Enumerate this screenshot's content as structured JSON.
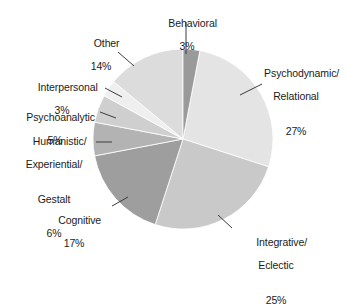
{
  "chart_data": {
    "type": "pie",
    "title": "",
    "subtitle": "",
    "xlabel": "",
    "ylabel": "",
    "legend_position": "none",
    "grid": false,
    "labels_show_percent": true,
    "categories": [
      "Psychodynamic/\nRelational",
      "Integrative/\nEclectic",
      "Cognitive",
      "Humanistic/\nExperiential/\nGestalt",
      "Psychoanalytic",
      "Interpersonal",
      "Other",
      "Behavioral"
    ],
    "values": [
      27,
      25,
      17,
      6,
      5,
      3,
      14,
      3
    ],
    "slices": [
      {
        "name": "Psychodynamic/Relational",
        "label_lines": [
          "Psychodynamic/",
          "Relational"
        ],
        "percent_text": "27%",
        "value": 27,
        "color": "#e4e4e4",
        "start_deg": 10.8,
        "end_deg": 108.0
      },
      {
        "name": "Integrative/Eclectic",
        "label_lines": [
          "Integrative/",
          "Eclectic"
        ],
        "percent_text": "25%",
        "value": 25,
        "color": "#c9c9c9",
        "start_deg": 108.0,
        "end_deg": 198.0
      },
      {
        "name": "Cognitive",
        "label_lines": [
          "Cognitive"
        ],
        "percent_text": "17%",
        "value": 17,
        "color": "#9e9e9e",
        "start_deg": 198.0,
        "end_deg": 259.2
      },
      {
        "name": "Humanistic/Experiential/Gestalt",
        "label_lines": [
          "Humanistic/",
          "Experiential/",
          "Gestalt"
        ],
        "percent_text": "6%",
        "value": 6,
        "color": "#b3b3b3",
        "start_deg": 259.2,
        "end_deg": 280.8
      },
      {
        "name": "Psychoanalytic",
        "label_lines": [
          "Psychoanalytic"
        ],
        "percent_text": "5%",
        "value": 5,
        "color": "#cfcfcf",
        "start_deg": 280.8,
        "end_deg": 298.8
      },
      {
        "name": "Interpersonal",
        "label_lines": [
          "Interpersonal"
        ],
        "percent_text": "3%",
        "value": 3,
        "color": "#efefef",
        "start_deg": 298.8,
        "end_deg": 309.6
      },
      {
        "name": "Other",
        "label_lines": [
          "Other"
        ],
        "percent_text": "14%",
        "value": 14,
        "color": "#dcdcdc",
        "start_deg": 309.6,
        "end_deg": 360.0
      },
      {
        "name": "Behavioral",
        "label_lines": [
          "Behavioral"
        ],
        "percent_text": "3%",
        "value": 3,
        "color": "#9a9a9a",
        "start_deg": 0.0,
        "end_deg": 10.8
      }
    ],
    "geometry": {
      "center_x": 183,
      "center_y": 139,
      "radius": 90
    },
    "colors": {
      "background": "#ffffff",
      "text": "#1b1b1b",
      "leader_line": "#3c3c3c"
    }
  },
  "labels": {
    "behavioral": {
      "l1": "Behavioral",
      "pct": "3%"
    },
    "psychodynamic": {
      "l1": "Psychodynamic/",
      "l2": "Relational",
      "pct": "27%"
    },
    "integrative": {
      "l1": "Integrative/",
      "l2": "Eclectic",
      "pct": "25%"
    },
    "cognitive": {
      "l1": "Cognitive",
      "pct": "17%"
    },
    "humanistic": {
      "l1": "Humanistic/",
      "l2": "Experiential/",
      "l3": "Gestalt",
      "pct": "6%"
    },
    "psychoanalytic": {
      "l1": "Psychoanalytic",
      "pct": "5%"
    },
    "interpersonal": {
      "l1": "Interpersonal",
      "pct": "3%"
    },
    "other": {
      "l1": "Other",
      "pct": "14%"
    }
  }
}
